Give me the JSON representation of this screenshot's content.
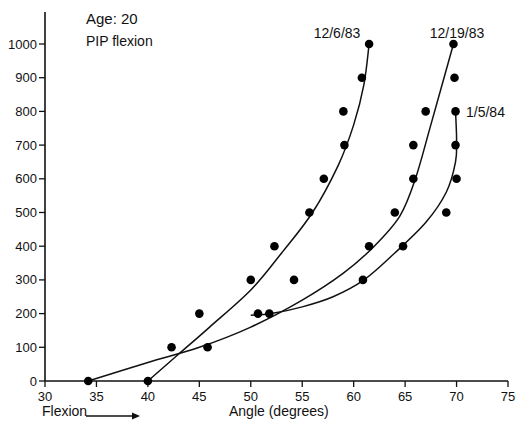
{
  "chart_data": {
    "type": "scatter",
    "title": "Age: 20",
    "subtitle": "PIP flexion",
    "xlabel": "Angle (degrees)",
    "ylabel": "",
    "x_annotation": "Flexion",
    "xlim": [
      30,
      75
    ],
    "ylim": [
      0,
      1000
    ],
    "x_ticks": [
      30,
      35,
      40,
      45,
      50,
      55,
      60,
      65,
      70,
      75
    ],
    "y_ticks": [
      0,
      100,
      200,
      300,
      400,
      500,
      600,
      700,
      800,
      900,
      1000
    ],
    "grid": false,
    "legend": "inline labels at curve ends",
    "series": [
      {
        "name": "12/6/83",
        "points": [
          [
            40,
            0
          ],
          [
            42.3,
            100
          ],
          [
            45,
            200
          ],
          [
            50,
            300
          ],
          [
            52.3,
            400
          ],
          [
            55.7,
            500
          ],
          [
            57.1,
            600
          ],
          [
            59.1,
            700
          ],
          [
            59,
            800
          ],
          [
            60.8,
            900
          ],
          [
            61.5,
            1000
          ]
        ],
        "curve": [
          [
            40,
            0
          ],
          [
            43,
            80
          ],
          [
            46,
            160
          ],
          [
            50,
            270
          ],
          [
            53,
            380
          ],
          [
            56,
            500
          ],
          [
            58.5,
            640
          ],
          [
            60,
            760
          ],
          [
            61,
            880
          ],
          [
            61.5,
            1000
          ]
        ]
      },
      {
        "name": "12/19/83",
        "points": [
          [
            34.2,
            0
          ],
          [
            45.8,
            100
          ],
          [
            51.8,
            200
          ],
          [
            61.5,
            400
          ],
          [
            64,
            500
          ],
          [
            65.8,
            600
          ],
          [
            65.8,
            700
          ],
          [
            67,
            800
          ],
          [
            69.8,
            900
          ],
          [
            69.7,
            1000
          ]
        ],
        "curve": [
          [
            34.2,
            0
          ],
          [
            40,
            55
          ],
          [
            45,
            100
          ],
          [
            50,
            160
          ],
          [
            55,
            240
          ],
          [
            59,
            320
          ],
          [
            62,
            400
          ],
          [
            64.5,
            490
          ],
          [
            66,
            600
          ],
          [
            67.5,
            760
          ],
          [
            69.7,
            1000
          ]
        ]
      },
      {
        "name": "1/5/84",
        "points": [
          [
            50.7,
            200
          ],
          [
            54.2,
            300
          ],
          [
            60.9,
            300
          ],
          [
            64.8,
            400
          ],
          [
            69,
            500
          ],
          [
            70,
            600
          ],
          [
            69.9,
            700
          ],
          [
            69.9,
            800
          ]
        ],
        "curve": [
          [
            50,
            195
          ],
          [
            52,
            200
          ],
          [
            55,
            220
          ],
          [
            58,
            250
          ],
          [
            61,
            300
          ],
          [
            64,
            380
          ],
          [
            67,
            470
          ],
          [
            69,
            560
          ],
          [
            69.9,
            650
          ],
          [
            70,
            720
          ],
          [
            69.9,
            800
          ]
        ]
      }
    ]
  },
  "labels": {
    "title": "Age: 20",
    "subtitle": "PIP flexion",
    "xlabel": "Angle (degrees)",
    "flexion": "Flexion",
    "s1": "12/6/83",
    "s2": "12/19/83",
    "s3": "1/5/84"
  },
  "y_tick_labels": [
    "0",
    "100",
    "200",
    "300",
    "400",
    "500",
    "600",
    "700",
    "800",
    "900",
    "1000"
  ],
  "x_tick_labels": [
    "30",
    "35",
    "40",
    "45",
    "50",
    "55",
    "60",
    "65",
    "70",
    "75"
  ]
}
